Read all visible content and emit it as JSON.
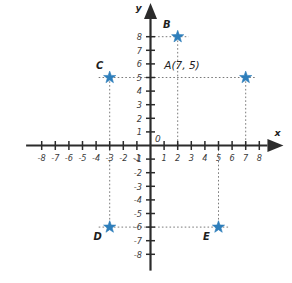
{
  "chart_data": {
    "type": "scatter",
    "title": "",
    "xlabel": "x",
    "ylabel": "y",
    "origin_label": "0",
    "xlim": [
      -9,
      9
    ],
    "ylim": [
      -9,
      9
    ],
    "grid": false,
    "legend": "none",
    "x_ticks": [
      -8,
      -7,
      -6,
      -5,
      -4,
      -3,
      -2,
      -1,
      1,
      2,
      3,
      4,
      5,
      6,
      7,
      8
    ],
    "x_tick_labels": [
      "-8",
      "-7",
      "-6",
      "-5",
      "-4",
      "-3",
      "-2",
      "-1",
      "1",
      "2",
      "3",
      "4",
      "5",
      "6",
      "7",
      "8"
    ],
    "y_ticks": [
      -8,
      -7,
      -6,
      -5,
      -4,
      -3,
      -2,
      -1,
      1,
      2,
      3,
      4,
      5,
      6,
      7,
      8
    ],
    "y_tick_labels": [
      "-8",
      "-7",
      "-6",
      "-5",
      "-4",
      "-3",
      "-2",
      "-1",
      "1",
      "2",
      "3",
      "4",
      "5",
      "6",
      "7",
      "8"
    ],
    "marker": "star",
    "marker_color": "#2e7ebb",
    "points": [
      {
        "name": "A",
        "label": "A(7, 5)",
        "x": 7,
        "y": 5,
        "label_dx": -46,
        "label_dy": -9,
        "leader_h": true,
        "leader_v": true
      },
      {
        "name": "B",
        "label": "B",
        "x": 2,
        "y": 8,
        "label_dx": -11,
        "label_dy": -9,
        "leader_h": true,
        "leader_v": true
      },
      {
        "name": "C",
        "label": "C",
        "x": -3,
        "y": 5,
        "label_dx": -10,
        "label_dy": -9,
        "leader_h": true,
        "leader_v": true
      },
      {
        "name": "D",
        "label": "D",
        "x": -3,
        "y": -6,
        "label_dx": -12,
        "label_dy": 13,
        "leader_h": true,
        "leader_v": true
      },
      {
        "name": "E",
        "label": "E",
        "x": 5,
        "y": -6,
        "label_dx": -12,
        "label_dy": 13,
        "leader_h": true,
        "leader_v": true
      }
    ]
  },
  "figure": {
    "axis_color": "#2b2b2b",
    "leader_color": "#7a7a7a",
    "background": "#ffffff"
  }
}
